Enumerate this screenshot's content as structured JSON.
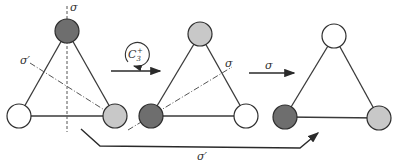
{
  "colors": {
    "dark": "#6e6e6e",
    "light": "#c8c8c8",
    "white": "#ffffff"
  },
  "triangles": [
    {
      "name": "initial",
      "atoms": {
        "top": "dark",
        "left": "white",
        "right": "light"
      }
    },
    {
      "name": "after-c3",
      "atoms": {
        "top": "light",
        "left": "dark",
        "right": "white"
      }
    },
    {
      "name": "after-sigma",
      "atoms": {
        "top": "white",
        "left": "dark",
        "right": "light"
      }
    }
  ],
  "labels": {
    "sigma_vertical": "σ",
    "sigma_prime_diag": "σ′",
    "c3_rotation": "C",
    "c3_sub": "3",
    "c3_sup": "+",
    "sigma_mid": "σ",
    "sigma_arrow": "σ",
    "sigma_prime_bottom": "σ′"
  }
}
